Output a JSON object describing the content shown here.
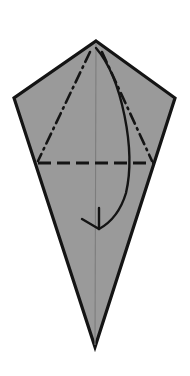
{
  "figure": {
    "kind": "origami-instruction",
    "canvas": {
      "width": 190,
      "height": 376,
      "background": "#ffffff"
    },
    "paper": {
      "name": "kite-shaped paper",
      "fill_color": "#9a9a9a",
      "outline_color": "#141414",
      "outline_width": 3.2,
      "vertices": [
        {
          "label": "top-apex",
          "x": 96,
          "y": 41
        },
        {
          "label": "right-corner",
          "x": 175,
          "y": 98
        },
        {
          "label": "bottom-point",
          "x": 95,
          "y": 347
        },
        {
          "label": "left-corner",
          "x": 14,
          "y": 98
        }
      ],
      "points_path": "96,41 175,98 95,347 14,98"
    },
    "center_line": {
      "name": "vertical-center-crease",
      "color": "#7d7d7d",
      "width": 1.1,
      "x1": 96,
      "y1": 43,
      "x2": 95,
      "y2": 345
    },
    "folds": [
      {
        "name": "left-valley-fold",
        "style": "dash-dot",
        "color": "#141414",
        "width": 2.6,
        "dash_pattern": "11 5 1.6 5",
        "x1": 90,
        "y1": 52,
        "x2": 38,
        "y2": 161
      },
      {
        "name": "right-valley-fold",
        "style": "dash-dot",
        "color": "#141414",
        "width": 2.6,
        "dash_pattern": "11 5 1.6 5",
        "x1": 102,
        "y1": 52,
        "x2": 152,
        "y2": 161
      },
      {
        "name": "horizontal-mountain-fold",
        "style": "dashed",
        "color": "#141414",
        "width": 3.0,
        "dash_pattern": "13 6",
        "x1": 38,
        "y1": 163,
        "x2": 153,
        "y2": 163
      }
    ],
    "arrow": {
      "name": "fold-down-arrow",
      "direction": "downward",
      "color": "#141414",
      "width": 2.4,
      "path": "M 96 48 C 122 78, 136 150, 126 193 C 120 213, 110 223, 99 229",
      "head_path": "M 99 229 L 99 208 M 99 229 L 82 219",
      "tip": {
        "x": 99,
        "y": 229
      },
      "start": {
        "x": 96,
        "y": 48
      }
    }
  }
}
